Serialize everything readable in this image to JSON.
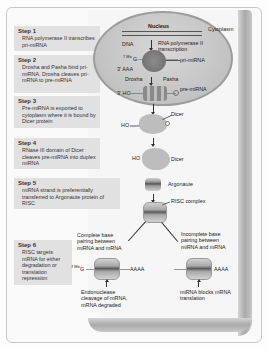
{
  "steps": [
    {
      "title": "Step 1",
      "text": "RNA polymerase II transcribes pri-miRNA"
    },
    {
      "title": "Step 2",
      "text": "Drosha and Pasha bind pri-miRNA, Drosha cleaves pri-mRNA to pre-miRNA"
    },
    {
      "title": "Step 3",
      "text": "Pre-miRNA is exported to cytoplasm where it is bound by Dicer protein"
    },
    {
      "title": "Step 4",
      "text": "RNase III domain of Dicer cleaves pre-miRNA into duplex miRNA"
    },
    {
      "title": "Step 5",
      "text": "miRNA strand is preferentially transferred to Argonaute protein of RISC"
    },
    {
      "title": "Step 6",
      "text": "RISC targets mRNA for either degradation or translation repression"
    }
  ],
  "diagram": {
    "nucleus": "Nucleus",
    "cytoplasm": "Cytoplasm",
    "dna": "DNA",
    "transcription": "RNA polymerase II transcription",
    "cap": "7 MeG",
    "cap_sup": "7 Me",
    "cap_g": "G",
    "three_prime_aaa": "3' AAA",
    "pri_mirna": "pri-miRNA",
    "drosha": "Drosha",
    "pasha": "Pasha",
    "three_prime_ho": "3' HO",
    "pre_mirna": "pre-miRNA",
    "dicer_1": "Dicer",
    "ho_1": "HO",
    "ho_2": "HO",
    "dicer_2": "Dicer",
    "argonaute": "Argonaute",
    "risc_complex": "RISC complex",
    "complete_pairing": "Complete base pairing between miRNA and mRNA",
    "incomplete_pairing": "Incomplete base pairing between miRNA and mRNA",
    "aaaa_left": "AAAA",
    "aaaa_right": "AAAA",
    "endonuclease": "Endonuclease cleavage of mRNA, mRNA degraded",
    "blocks": "miRNA blocks mRNA translation"
  }
}
